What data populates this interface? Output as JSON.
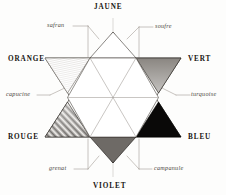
{
  "figure": {
    "kind": "chromatic-hexagram",
    "background_color": "#fdfdfc",
    "ink_color": "#181512",
    "leader_line_color": "#8d8781"
  },
  "primary_labels": [
    {
      "id": "jaune",
      "text": "JAUNE",
      "position": "top"
    },
    {
      "id": "vert",
      "text": "VERT",
      "position": "upper-right"
    },
    {
      "id": "bleu",
      "text": "BLEU",
      "position": "lower-right"
    },
    {
      "id": "violet",
      "text": "VIOLET",
      "position": "bottom"
    },
    {
      "id": "rouge",
      "text": "ROUGE",
      "position": "lower-left"
    },
    {
      "id": "orange",
      "text": "ORANGE",
      "position": "upper-left"
    }
  ],
  "tint_labels": [
    {
      "id": "safran",
      "text": "safran",
      "position": "top-left"
    },
    {
      "id": "soufre",
      "text": "soufre",
      "position": "top-right"
    },
    {
      "id": "turquoise",
      "text": "turquoise",
      "position": "mid-right"
    },
    {
      "id": "campanule",
      "text": "campanule",
      "position": "bottom-right"
    },
    {
      "id": "grenat",
      "text": "grenat",
      "position": "bottom-left"
    },
    {
      "id": "capucine",
      "text": "capucine",
      "position": "mid-left"
    }
  ],
  "triangles": [
    {
      "id": "orange-wedge",
      "label": "ORANGE",
      "tone": "very-light",
      "fill": "#cfcbc6"
    },
    {
      "id": "vert-wedge",
      "label": "VERT",
      "tone": "dark",
      "fill": "#3a3632"
    },
    {
      "id": "bleu-wedge",
      "label": "BLEU",
      "tone": "solid-black",
      "fill": "#0a0908"
    },
    {
      "id": "violet-wedge",
      "label": "VIOLET",
      "tone": "dark",
      "fill": "#1f1c19"
    },
    {
      "id": "rouge-wedge",
      "label": "ROUGE",
      "tone": "medium-dark",
      "fill": "#2a2623"
    },
    {
      "id": "jaune-wedge",
      "label": "JAUNE",
      "tone": "white",
      "fill": "#ffffff"
    }
  ],
  "center": {
    "shape": "hexagon",
    "fill": "#ffffff",
    "has_radiating_lines": true,
    "radiating_line_count": 6
  }
}
